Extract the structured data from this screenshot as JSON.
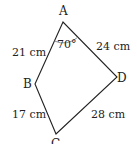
{
  "figure": {
    "type": "quadrilateral",
    "vertices": [
      {
        "label": "A",
        "x": 63,
        "y": 22
      },
      {
        "label": "B",
        "x": 35,
        "y": 84
      },
      {
        "label": "C",
        "x": 56,
        "y": 134
      },
      {
        "label": "D",
        "x": 117,
        "y": 77
      }
    ],
    "sides": {
      "AB": "21 cm",
      "AD": "24 cm",
      "BC": "17 cm",
      "CD": "28 cm"
    },
    "angle_A": "70°",
    "line_color": "#222222"
  }
}
